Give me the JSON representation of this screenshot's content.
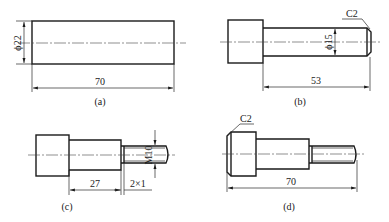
{
  "figure": {
    "views": [
      {
        "caption": "(a)",
        "part": "blank bar",
        "dimensions": {
          "diameter": "ϕ22",
          "length": "70"
        }
      },
      {
        "caption": "(b)",
        "part": "turned shaft",
        "dimensions": {
          "diameter": "ϕ15",
          "length": "53",
          "chamfer": "C2"
        }
      },
      {
        "caption": "(c)",
        "part": "threaded shaft",
        "dimensions": {
          "thread": "M10",
          "length": "27",
          "undercut": "2×1"
        }
      },
      {
        "caption": "(d)",
        "part": "finished part",
        "dimensions": {
          "length": "70",
          "chamfer": "C2"
        }
      }
    ]
  }
}
